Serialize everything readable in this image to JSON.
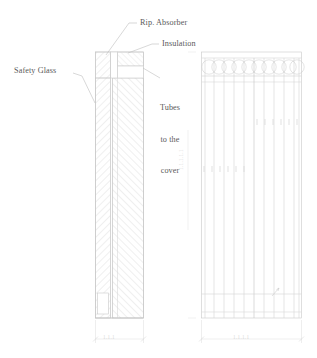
{
  "drawing": {
    "title": "Flat plate solar collector - cross section and front elevation",
    "type": "technical-drawing",
    "line_color": "#c9c9c9",
    "hatch_color": "#d9d9d9",
    "text_color": "#5a5a5a",
    "dim_text_color": "#d8d8d8",
    "background": "#ffffff"
  },
  "annotations": {
    "safety_glass": "Safety Glass",
    "rip_absorber": "Rip. Absorber",
    "insulation": "Insulation",
    "tubes_to_cover_line1": "Tubes",
    "tubes_to_cover_line2": "to the",
    "tubes_to_cover_line3": "cover"
  },
  "dimensions": {
    "section_width_label": "1.1.1",
    "elevation_width_label": "1.1.1.1",
    "elevation_height_label": "1.1.1.1.1"
  },
  "section_view": {
    "name": "cross-section",
    "x": 93,
    "y": 51,
    "width": 53,
    "height": 273,
    "bands": [
      {
        "name": "safety-glass-band",
        "x": 95,
        "width": 15,
        "hatch": "diag-left"
      },
      {
        "name": "absorber-insulation-band",
        "x": 112,
        "width": 32,
        "hatch": "diag-right"
      }
    ],
    "top_blocks": 2,
    "bottom_notch": true
  },
  "elevation_view": {
    "name": "front-elevation",
    "x": 201,
    "y": 51,
    "width": 101,
    "height": 273,
    "circle_count": 10,
    "tube_count": 11,
    "tick_rows": 2,
    "ticks_per_row": 6,
    "header_band": true,
    "footer_band": true
  }
}
